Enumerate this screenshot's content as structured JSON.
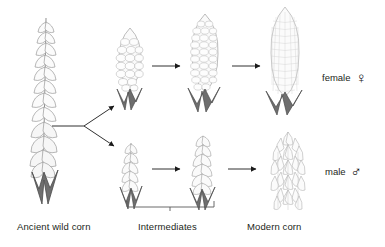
{
  "diagram": {
    "background_color": "#ffffff",
    "ink_color": "#231f20",
    "plant_outline_color": "#9a9a9a",
    "plant_fill_color": "#f2f2f2",
    "husk_color": "#6e6e6e"
  },
  "labels": {
    "ancient": "Ancient wild corn",
    "intermediates": "Intermediates",
    "modern": "Modern corn",
    "female": "female",
    "male": "male"
  },
  "glyphs": {
    "female_symbol": "♀",
    "female_icon_name": "venus-female-symbol",
    "male_symbol": "♂",
    "male_icon_name": "mars-male-symbol"
  },
  "rows": [
    {
      "id": "female-row",
      "sex": "female",
      "organ": "ear",
      "stages": [
        {
          "name": "intermediate-ear-small",
          "stage_index": 1,
          "kernel_rows": 7,
          "kernel_cols": 4
        },
        {
          "name": "intermediate-ear-large",
          "stage_index": 2,
          "kernel_rows": 11,
          "kernel_cols": 6
        },
        {
          "name": "modern-ear",
          "stage_index": 3,
          "kernel_rows": 17,
          "kernel_cols": 9
        }
      ]
    },
    {
      "id": "male-row",
      "sex": "male",
      "organ": "tassel",
      "stages": [
        {
          "name": "intermediate-tassel-small",
          "stage_index": 1
        },
        {
          "name": "intermediate-tassel-large",
          "stage_index": 2
        },
        {
          "name": "modern-tassel",
          "stage_index": 3
        }
      ]
    }
  ],
  "ancestor": {
    "name": "ancient-wild-corn-spike",
    "description": "slender branched spike with scattered seeds"
  },
  "connectors": {
    "branch_name": "branching-arrow-from-ancestor",
    "branch_targets": 2,
    "arrow_count_female": 2,
    "arrow_count_male": 2,
    "bracket_name": "intermediates-bracket",
    "bracket_span": "stage1-to-stage2"
  }
}
